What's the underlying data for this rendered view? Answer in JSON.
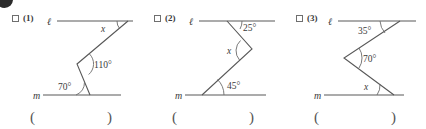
{
  "worksheet": {
    "corner_marker": "filled-circle-marker",
    "answer_open_paren": "(",
    "answer_close_paren": ")"
  },
  "panels": [
    {
      "id": "1",
      "number_label": "(1)",
      "checkbox_checked": false,
      "top_line_label": "ℓ",
      "bottom_line_label": "m",
      "answer_value": "",
      "angles": [
        {
          "name": "top-angle",
          "label": "x",
          "is_unknown": true
        },
        {
          "name": "middle-angle",
          "label": "110°",
          "is_unknown": false
        },
        {
          "name": "bottom-angle",
          "label": "70°",
          "is_unknown": false
        }
      ]
    },
    {
      "id": "2",
      "number_label": "(2)",
      "checkbox_checked": false,
      "top_line_label": "ℓ",
      "bottom_line_label": "m",
      "answer_value": "",
      "angles": [
        {
          "name": "top-angle",
          "label": "25°",
          "is_unknown": false
        },
        {
          "name": "middle-angle",
          "label": "x",
          "is_unknown": true
        },
        {
          "name": "bottom-angle",
          "label": "45°",
          "is_unknown": false
        }
      ]
    },
    {
      "id": "3",
      "number_label": "(3)",
      "checkbox_checked": false,
      "top_line_label": "ℓ",
      "bottom_line_label": "m",
      "answer_value": "",
      "angles": [
        {
          "name": "top-angle",
          "label": "35°",
          "is_unknown": false
        },
        {
          "name": "middle-angle",
          "label": "70°",
          "is_unknown": false
        },
        {
          "name": "bottom-angle",
          "label": "x",
          "is_unknown": true
        }
      ]
    }
  ],
  "colors": {
    "ink": "#3a3a3a",
    "stroke": "#585858",
    "arc": "#6b6b6b",
    "marker": "#2b2b2b",
    "background": "#ffffff"
  }
}
